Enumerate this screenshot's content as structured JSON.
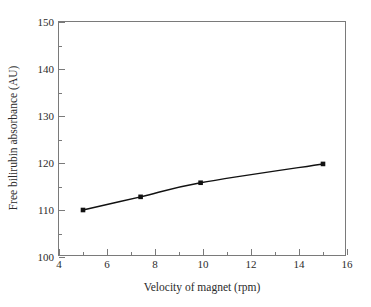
{
  "chart_data": {
    "type": "line",
    "title": "",
    "xlabel": "Velocity of magnet (rpm)",
    "ylabel": "Free bilirubin absorbance (AU)",
    "xlim": [
      4,
      16
    ],
    "ylim": [
      100,
      150
    ],
    "xticks": [
      4,
      6,
      8,
      10,
      12,
      14,
      16
    ],
    "yticks": [
      100,
      110,
      120,
      130,
      140,
      150
    ],
    "x_minor_ticks": [
      5,
      7,
      9,
      11,
      13,
      15
    ],
    "y_minor_ticks": [
      105,
      115,
      125,
      135,
      145
    ],
    "xtick_labels": [
      "4",
      "6",
      "8",
      "10",
      "12",
      "14",
      "16"
    ],
    "ytick_labels": [
      "100",
      "110",
      "120",
      "130",
      "140",
      "150"
    ],
    "grid": false,
    "legend": null,
    "series": [
      {
        "name": "Free bilirubin absorbance",
        "marker": "square",
        "color": "#111111",
        "x": [
          5.0,
          7.4,
          9.9,
          15.0
        ],
        "y": [
          110.0,
          112.8,
          115.8,
          119.8
        ]
      }
    ]
  },
  "figure": {
    "background_color": "#ffffff",
    "axis_color": "#7a7a7a",
    "text_color": "#2b2b2b"
  }
}
